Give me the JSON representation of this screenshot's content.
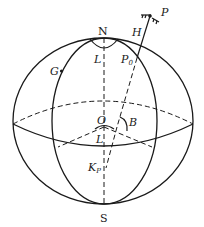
{
  "diagram": {
    "labels": {
      "north": "N",
      "south": "S",
      "center": "O",
      "point_p": "P",
      "height": "H",
      "foot_point": "P",
      "foot_point_sub": "0",
      "longitude_top": "L",
      "longitude_center": "L",
      "latitude": "B",
      "greenwich": "G",
      "kp": "K",
      "kp_sub": "P"
    },
    "colors": {
      "stroke": "#1a1a1a",
      "background": "#ffffff"
    }
  }
}
